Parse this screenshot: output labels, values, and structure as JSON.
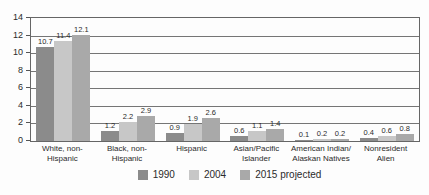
{
  "chart_data": {
    "type": "bar",
    "title": "",
    "xlabel": "",
    "ylabel": "",
    "ylim": [
      0,
      14
    ],
    "yticks": [
      0,
      2,
      4,
      6,
      8,
      10,
      12,
      14
    ],
    "grid": true,
    "legend_position": "bottom",
    "categories": [
      "White, non-\nHispanic",
      "Black, non-\nHispanic",
      "Hispanic",
      "Asian/Pacific\nIslander",
      "American Indian/\nAlaskan Natives",
      "Nonresident\nAlien"
    ],
    "series": [
      {
        "name": "1990",
        "color": "#8b8b8b",
        "values": [
          10.7,
          1.2,
          0.9,
          0.6,
          0.1,
          0.4
        ]
      },
      {
        "name": "2004",
        "color": "#c7c7c7",
        "values": [
          11.4,
          2.2,
          1.9,
          1.1,
          0.2,
          0.6
        ]
      },
      {
        "name": "2015 projected",
        "color": "#a9a9a9",
        "values": [
          12.1,
          2.9,
          2.6,
          1.4,
          0.2,
          0.8
        ]
      }
    ],
    "colors": {
      "gridline": "#757575",
      "plot_border": "#666666",
      "text": "#2b2b2b"
    }
  }
}
